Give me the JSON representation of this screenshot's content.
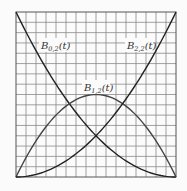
{
  "chart_data": {
    "type": "line",
    "title": "",
    "xlabel": "t",
    "ylabel": "",
    "xlim": [
      0,
      1
    ],
    "ylim": [
      0,
      1
    ],
    "grid": true,
    "grid_divisions": {
      "x": 16,
      "y": 16
    },
    "x": [
      0,
      0.125,
      0.25,
      0.375,
      0.5,
      0.625,
      0.75,
      0.875,
      1
    ],
    "series": [
      {
        "name": "B_{0,2}(t)",
        "label": "B0,2(t)",
        "formula": "(1-t)^2",
        "values": [
          1,
          0.7656,
          0.5625,
          0.3906,
          0.25,
          0.1406,
          0.0625,
          0.0156,
          0
        ]
      },
      {
        "name": "B_{1,2}(t)",
        "label": "B1,2(t)",
        "formula": "2t(1-t)",
        "values": [
          0,
          0.2188,
          0.375,
          0.4688,
          0.5,
          0.4688,
          0.375,
          0.2188,
          0
        ]
      },
      {
        "name": "B_{2,2}(t)",
        "label": "B2,2(t)",
        "formula": "t^2",
        "values": [
          0,
          0.0156,
          0.0625,
          0.1406,
          0.25,
          0.3906,
          0.5625,
          0.7656,
          1
        ]
      }
    ],
    "annotations": [
      {
        "text": "B",
        "sub": "0,2",
        "suffix": "(t)"
      },
      {
        "text": "B",
        "sub": "1,2",
        "suffix": "(t)"
      },
      {
        "text": "B",
        "sub": "2,2",
        "suffix": "(t)"
      }
    ]
  },
  "labels": {
    "b02": {
      "main": "B",
      "sub": "0,2",
      "arg": "(t)"
    },
    "b12": {
      "main": "B",
      "sub": "1,2",
      "arg": "(t)"
    },
    "b22": {
      "main": "B",
      "sub": "2,2",
      "arg": "(t)"
    }
  }
}
